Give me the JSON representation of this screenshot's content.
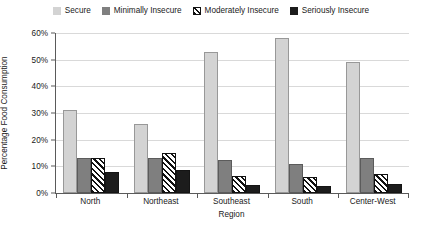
{
  "chart_data": {
    "type": "bar",
    "title": "",
    "xlabel": "Region",
    "ylabel": "Percentage Food Consumption",
    "categories": [
      "North",
      "Northeast",
      "Southeast",
      "South",
      "Center-West"
    ],
    "ylim": [
      0,
      60
    ],
    "ytick_labels": [
      "0%",
      "10%",
      "20%",
      "30%",
      "40%",
      "50%",
      "60%"
    ],
    "ytick_values": [
      0,
      10,
      20,
      30,
      40,
      50,
      60
    ],
    "grid": true,
    "legend_position": "top-center",
    "series": [
      {
        "name": "Secure",
        "color": "#d3d3d3",
        "pattern": "solid",
        "values": [
          31,
          26,
          53,
          58,
          49
        ]
      },
      {
        "name": "Minimally Insecure",
        "color": "#7f7f7f",
        "pattern": "solid",
        "values": [
          13,
          13,
          12.5,
          11,
          13
        ]
      },
      {
        "name": "Moderately Insecure",
        "color": "#ffffff",
        "pattern": "diagonal-hatch",
        "values": [
          13,
          15,
          6.5,
          6,
          7
        ]
      },
      {
        "name": "Seriously Insecure",
        "color": "#1c1c1c",
        "pattern": "solid",
        "values": [
          8,
          8.5,
          3,
          2.5,
          3.5
        ]
      }
    ]
  }
}
